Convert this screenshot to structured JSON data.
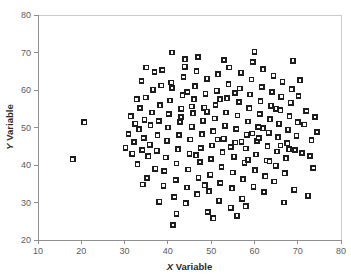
{
  "chart_data": {
    "type": "scatter",
    "title": "",
    "subtitle": "",
    "xlabel": "X Variable",
    "ylabel": "Y Variable",
    "xlabel_letter": "X",
    "xlabel_rest": " Variable",
    "ylabel_letter": "Y",
    "ylabel_rest": " Variable",
    "xlim": [
      10,
      80
    ],
    "ylim": [
      20,
      80
    ],
    "xticks": [
      10,
      20,
      30,
      40,
      50,
      60,
      70,
      80
    ],
    "yticks": [
      20,
      30,
      40,
      50,
      60,
      70,
      80
    ],
    "xtick_labels": [
      "10",
      "20",
      "30",
      "40",
      "50",
      "60",
      "70",
      "80"
    ],
    "ytick_labels": [
      "20",
      "30",
      "40",
      "50",
      "60",
      "70",
      "80"
    ],
    "grid": false,
    "legend": false,
    "marker": "open-square",
    "marker_color": "#1d1d1d",
    "marker_fill": "#ffffff",
    "n_points": 186,
    "points": [
      [
        18.0,
        41.5
      ],
      [
        20.7,
        51.4
      ],
      [
        30.2,
        44.6
      ],
      [
        30.9,
        48.3
      ],
      [
        31.4,
        53.0
      ],
      [
        31.8,
        43.0
      ],
      [
        32.2,
        46.1
      ],
      [
        32.5,
        51.0
      ],
      [
        32.8,
        57.5
      ],
      [
        33.0,
        40.2
      ],
      [
        33.3,
        49.5
      ],
      [
        33.6,
        55.2
      ],
      [
        33.9,
        62.4
      ],
      [
        34.1,
        44.0
      ],
      [
        34.4,
        47.2
      ],
      [
        34.6,
        52.1
      ],
      [
        34.9,
        58.0
      ],
      [
        35.2,
        36.5
      ],
      [
        35.5,
        42.3
      ],
      [
        35.8,
        45.4
      ],
      [
        36.0,
        50.6
      ],
      [
        36.3,
        54.0
      ],
      [
        36.6,
        60.1
      ],
      [
        36.9,
        64.8
      ],
      [
        37.1,
        39.0
      ],
      [
        37.4,
        43.8
      ],
      [
        37.6,
        47.9
      ],
      [
        37.9,
        51.7
      ],
      [
        38.2,
        55.9
      ],
      [
        38.5,
        61.2
      ],
      [
        38.7,
        65.3
      ],
      [
        39.0,
        34.5
      ],
      [
        39.2,
        38.4
      ],
      [
        39.5,
        42.0
      ],
      [
        39.8,
        46.5
      ],
      [
        40.0,
        50.0
      ],
      [
        40.2,
        53.6
      ],
      [
        40.5,
        57.2
      ],
      [
        40.8,
        62.0
      ],
      [
        41.0,
        70.0
      ],
      [
        41.2,
        24.0
      ],
      [
        41.5,
        31.5
      ],
      [
        41.8,
        36.0
      ],
      [
        42.0,
        40.4
      ],
      [
        42.3,
        44.2
      ],
      [
        42.6,
        48.0
      ],
      [
        42.8,
        51.5
      ],
      [
        43.1,
        55.0
      ],
      [
        43.4,
        58.6
      ],
      [
        43.6,
        63.5
      ],
      [
        43.9,
        66.2
      ],
      [
        44.1,
        29.8
      ],
      [
        44.4,
        34.0
      ],
      [
        44.7,
        38.8
      ],
      [
        45.0,
        43.0
      ],
      [
        45.2,
        46.8
      ],
      [
        45.5,
        50.2
      ],
      [
        45.8,
        53.8
      ],
      [
        46.0,
        57.5
      ],
      [
        46.3,
        61.0
      ],
      [
        46.6,
        65.0
      ],
      [
        46.8,
        32.2
      ],
      [
        47.1,
        36.6
      ],
      [
        47.4,
        40.8
      ],
      [
        47.6,
        44.5
      ],
      [
        47.9,
        48.2
      ],
      [
        48.1,
        51.8
      ],
      [
        48.4,
        55.3
      ],
      [
        48.7,
        59.0
      ],
      [
        49.0,
        63.0
      ],
      [
        49.2,
        27.5
      ],
      [
        49.5,
        33.0
      ],
      [
        49.8,
        37.4
      ],
      [
        50.0,
        41.6
      ],
      [
        50.2,
        45.2
      ],
      [
        50.5,
        49.0
      ],
      [
        50.8,
        52.4
      ],
      [
        51.0,
        56.0
      ],
      [
        51.3,
        59.8
      ],
      [
        51.6,
        64.2
      ],
      [
        51.8,
        30.5
      ],
      [
        52.1,
        35.2
      ],
      [
        52.4,
        39.5
      ],
      [
        52.6,
        43.4
      ],
      [
        52.9,
        47.0
      ],
      [
        53.2,
        50.5
      ],
      [
        53.4,
        54.0
      ],
      [
        53.7,
        57.8
      ],
      [
        54.0,
        61.5
      ],
      [
        54.2,
        66.0
      ],
      [
        54.5,
        28.6
      ],
      [
        54.8,
        33.8
      ],
      [
        55.0,
        38.0
      ],
      [
        55.3,
        42.2
      ],
      [
        55.6,
        46.0
      ],
      [
        55.8,
        49.6
      ],
      [
        56.1,
        53.2
      ],
      [
        56.4,
        56.8
      ],
      [
        56.6,
        60.4
      ],
      [
        56.9,
        64.6
      ],
      [
        57.2,
        31.0
      ],
      [
        57.4,
        36.2
      ],
      [
        57.7,
        40.6
      ],
      [
        58.0,
        44.4
      ],
      [
        58.2,
        48.1
      ],
      [
        58.5,
        51.6
      ],
      [
        58.8,
        55.1
      ],
      [
        59.0,
        58.8
      ],
      [
        59.3,
        62.8
      ],
      [
        59.6,
        67.5
      ],
      [
        59.8,
        34.2
      ],
      [
        60.1,
        38.6
      ],
      [
        60.4,
        42.8
      ],
      [
        60.6,
        46.4
      ],
      [
        60.9,
        50.1
      ],
      [
        61.2,
        53.6
      ],
      [
        61.4,
        57.0
      ],
      [
        61.7,
        60.8
      ],
      [
        62.0,
        65.5
      ],
      [
        62.2,
        32.8
      ],
      [
        62.5,
        37.0
      ],
      [
        62.8,
        41.2
      ],
      [
        63.0,
        45.0
      ],
      [
        63.3,
        48.6
      ],
      [
        63.6,
        52.2
      ],
      [
        63.8,
        55.8
      ],
      [
        64.1,
        59.5
      ],
      [
        64.4,
        63.8
      ],
      [
        64.6,
        35.6
      ],
      [
        64.9,
        39.8
      ],
      [
        65.2,
        43.6
      ],
      [
        65.4,
        47.4
      ],
      [
        65.7,
        51.0
      ],
      [
        66.0,
        54.6
      ],
      [
        66.2,
        58.2
      ],
      [
        66.5,
        62.2
      ],
      [
        66.8,
        30.0
      ],
      [
        67.0,
        37.8
      ],
      [
        67.3,
        41.8
      ],
      [
        67.6,
        45.8
      ],
      [
        67.8,
        49.4
      ],
      [
        68.1,
        53.0
      ],
      [
        68.4,
        56.6
      ],
      [
        68.6,
        60.2
      ],
      [
        68.9,
        67.8
      ],
      [
        69.2,
        33.4
      ],
      [
        69.4,
        44.0
      ],
      [
        69.7,
        47.8
      ],
      [
        70.0,
        51.4
      ],
      [
        70.2,
        58.4
      ],
      [
        70.5,
        62.6
      ],
      [
        71.0,
        43.2
      ],
      [
        71.5,
        50.8
      ],
      [
        72.0,
        54.4
      ],
      [
        72.4,
        31.8
      ],
      [
        72.8,
        42.4
      ],
      [
        73.2,
        46.6
      ],
      [
        73.6,
        39.2
      ],
      [
        74.0,
        52.8
      ],
      [
        74.5,
        48.8
      ],
      [
        34.2,
        34.8
      ],
      [
        35.0,
        66.0
      ],
      [
        38.0,
        30.2
      ],
      [
        42.0,
        27.0
      ],
      [
        44.0,
        68.2
      ],
      [
        47.0,
        68.8
      ],
      [
        50.5,
        25.8
      ],
      [
        53.0,
        68.0
      ],
      [
        56.0,
        26.5
      ],
      [
        58.0,
        29.0
      ],
      [
        60.0,
        70.2
      ],
      [
        44.5,
        59.5
      ],
      [
        46.5,
        42.6
      ],
      [
        48.5,
        34.6
      ],
      [
        51.5,
        46.8
      ],
      [
        54.5,
        44.8
      ],
      [
        57.0,
        46.2
      ],
      [
        59.5,
        48.4
      ],
      [
        61.0,
        47.2
      ],
      [
        63.5,
        41.0
      ],
      [
        66.0,
        45.2
      ],
      [
        41.0,
        60.5
      ],
      [
        43.0,
        52.8
      ],
      [
        45.5,
        55.6
      ],
      [
        49.0,
        54.2
      ],
      [
        52.0,
        57.5
      ],
      [
        55.5,
        59.2
      ],
      [
        58.5,
        41.4
      ],
      [
        62.0,
        49.8
      ],
      [
        65.0,
        55.0
      ],
      [
        68.0,
        44.2
      ]
    ]
  }
}
